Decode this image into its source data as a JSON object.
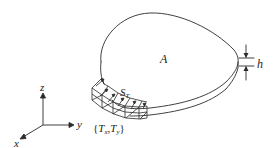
{
  "diagram": {
    "type": "3d-plate-with-traction",
    "labels": {
      "area": "A",
      "thickness": "h",
      "traction_surface": "S",
      "traction_surface_sub": "T",
      "traction_open": "{",
      "traction_T1": "T",
      "traction_T1_sub": "x",
      "traction_sep": ",",
      "traction_T2": "T",
      "traction_T2_sub": "y",
      "traction_close": "}"
    },
    "axes": {
      "x": "x",
      "y": "y",
      "z": "z"
    },
    "colors": {
      "line": "#2a2a2a",
      "background": "#ffffff"
    }
  }
}
